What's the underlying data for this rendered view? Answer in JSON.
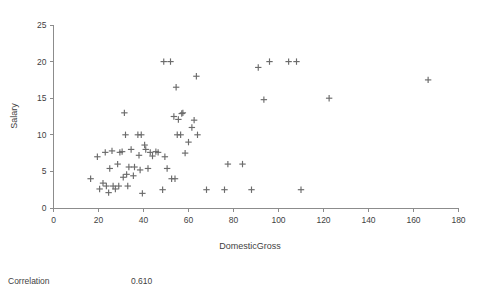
{
  "chart_data": {
    "type": "scatter",
    "title": "",
    "xlabel": "DomesticGross",
    "ylabel": "Salary",
    "xlim": [
      0,
      180
    ],
    "ylim": [
      0,
      25
    ],
    "xticks": [
      0,
      20,
      40,
      60,
      80,
      100,
      120,
      140,
      160,
      180
    ],
    "yticks": [
      0,
      5,
      10,
      15,
      20,
      25
    ],
    "grid": false,
    "legend": null,
    "marker": "plus",
    "marker_color": "#6b6b6b",
    "points": [
      {
        "x": 16.5,
        "y": 4.0
      },
      {
        "x": 19.5,
        "y": 7.0
      },
      {
        "x": 20.5,
        "y": 2.6
      },
      {
        "x": 22.0,
        "y": 3.4
      },
      {
        "x": 23.0,
        "y": 7.6
      },
      {
        "x": 23.5,
        "y": 3.0
      },
      {
        "x": 24.5,
        "y": 2.1
      },
      {
        "x": 25.0,
        "y": 5.4
      },
      {
        "x": 26.0,
        "y": 7.8
      },
      {
        "x": 26.5,
        "y": 3.0
      },
      {
        "x": 27.5,
        "y": 2.6
      },
      {
        "x": 28.5,
        "y": 6.0
      },
      {
        "x": 29.0,
        "y": 3.0
      },
      {
        "x": 29.5,
        "y": 7.6
      },
      {
        "x": 30.5,
        "y": 7.7
      },
      {
        "x": 31.0,
        "y": 4.2
      },
      {
        "x": 31.5,
        "y": 13.0
      },
      {
        "x": 32.0,
        "y": 10.0
      },
      {
        "x": 32.5,
        "y": 4.6
      },
      {
        "x": 33.0,
        "y": 3.0
      },
      {
        "x": 33.5,
        "y": 5.6
      },
      {
        "x": 34.5,
        "y": 8.0
      },
      {
        "x": 35.5,
        "y": 4.4
      },
      {
        "x": 36.0,
        "y": 5.6
      },
      {
        "x": 37.5,
        "y": 10.0
      },
      {
        "x": 38.0,
        "y": 7.2
      },
      {
        "x": 38.5,
        "y": 5.2
      },
      {
        "x": 39.0,
        "y": 10.0
      },
      {
        "x": 39.5,
        "y": 2.0
      },
      {
        "x": 40.5,
        "y": 8.6
      },
      {
        "x": 41.0,
        "y": 8.0
      },
      {
        "x": 42.0,
        "y": 5.4
      },
      {
        "x": 43.0,
        "y": 7.6
      },
      {
        "x": 44.0,
        "y": 7.1
      },
      {
        "x": 45.5,
        "y": 7.7
      },
      {
        "x": 46.5,
        "y": 7.6
      },
      {
        "x": 48.5,
        "y": 2.5
      },
      {
        "x": 49.0,
        "y": 20.0
      },
      {
        "x": 49.5,
        "y": 7.0
      },
      {
        "x": 50.5,
        "y": 5.4
      },
      {
        "x": 52.0,
        "y": 20.0
      },
      {
        "x": 52.5,
        "y": 4.0
      },
      {
        "x": 53.5,
        "y": 12.5
      },
      {
        "x": 54.0,
        "y": 4.0
      },
      {
        "x": 54.5,
        "y": 16.5
      },
      {
        "x": 55.0,
        "y": 10.0
      },
      {
        "x": 55.5,
        "y": 12.1
      },
      {
        "x": 56.5,
        "y": 10.0
      },
      {
        "x": 57.0,
        "y": 12.9
      },
      {
        "x": 57.5,
        "y": 13.0
      },
      {
        "x": 58.5,
        "y": 7.5
      },
      {
        "x": 60.0,
        "y": 9.0
      },
      {
        "x": 61.5,
        "y": 11.0
      },
      {
        "x": 62.5,
        "y": 12.0
      },
      {
        "x": 63.5,
        "y": 18.0
      },
      {
        "x": 64.0,
        "y": 10.0
      },
      {
        "x": 68.0,
        "y": 2.5
      },
      {
        "x": 76.0,
        "y": 2.5
      },
      {
        "x": 77.5,
        "y": 6.0
      },
      {
        "x": 84.0,
        "y": 6.0
      },
      {
        "x": 88.0,
        "y": 2.5
      },
      {
        "x": 91.0,
        "y": 19.2
      },
      {
        "x": 93.5,
        "y": 14.8
      },
      {
        "x": 96.0,
        "y": 20.0
      },
      {
        "x": 104.5,
        "y": 20.0
      },
      {
        "x": 108.0,
        "y": 20.0
      },
      {
        "x": 110.0,
        "y": 2.5
      },
      {
        "x": 122.5,
        "y": 15.0
      },
      {
        "x": 166.5,
        "y": 17.5
      }
    ]
  },
  "stats": {
    "label": "Correlation",
    "value": "0.610"
  }
}
